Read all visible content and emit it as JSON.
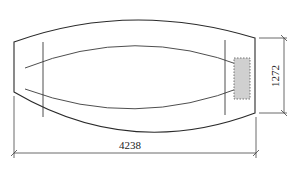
{
  "diagram": {
    "type": "technical drawing",
    "dimensions": {
      "width_label": "4238",
      "height_label": "1272"
    },
    "colors": {
      "line": "#2a2a2a",
      "shaded_region": "#d0d0d0",
      "background": "#ffffff"
    }
  }
}
